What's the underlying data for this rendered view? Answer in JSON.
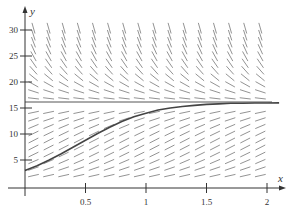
{
  "chart_data": {
    "type": "line",
    "title": "",
    "subtitle": "Slope field of logistic equation dy/dx = 3y(1 - y/16) with solution curve",
    "xlabel": "x",
    "ylabel": "y",
    "xlim": [
      0,
      2.1
    ],
    "ylim": [
      0,
      32
    ],
    "x_ticks": [
      "0.5",
      "1",
      "1.5",
      "2"
    ],
    "x_tick_values": [
      0.5,
      1,
      1.5,
      2
    ],
    "y_ticks": [
      "5",
      "10",
      "15",
      "20",
      "25",
      "30"
    ],
    "y_tick_values": [
      5,
      10,
      15,
      20,
      25,
      30
    ],
    "grid": false,
    "legend": null,
    "equilibrium": {
      "y": 16,
      "label": "y = 16"
    },
    "slope_field": {
      "rate": 3,
      "capacity": 16
    },
    "series": [
      {
        "name": "solution curve",
        "x": [
          0,
          0.1,
          0.2,
          0.3,
          0.4,
          0.5,
          0.6,
          0.7,
          0.8,
          0.9,
          1.0,
          1.1,
          1.2,
          1.3,
          1.4,
          1.5,
          1.6,
          1.7,
          1.8,
          1.9,
          2.0,
          2.1
        ],
        "values": [
          3.0,
          3.9,
          5.0,
          6.2,
          7.5,
          8.8,
          10.1,
          11.3,
          12.4,
          13.3,
          14.0,
          14.6,
          15.0,
          15.3,
          15.5,
          15.7,
          15.8,
          15.9,
          15.9,
          15.95,
          15.97,
          15.98
        ]
      }
    ]
  }
}
